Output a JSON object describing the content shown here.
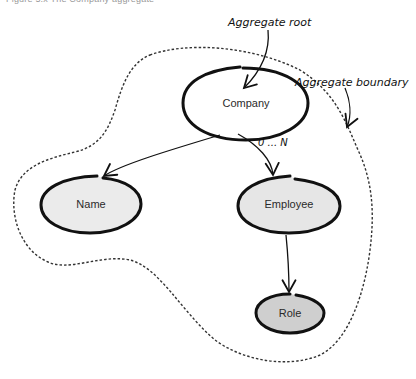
{
  "caption": "Figure 5.x  The Company aggregate",
  "annotations": {
    "aggregate_root": "Aggregate root",
    "aggregate_boundary": "Aggregate boundary",
    "multiplicity": "0 ... N"
  },
  "nodes": {
    "company": {
      "label": "Company",
      "fill": "#ffffff"
    },
    "name": {
      "label": "Name",
      "fill": "#ebebeb"
    },
    "employee": {
      "label": "Employee",
      "fill": "#e6e6e6"
    },
    "role": {
      "label": "Role",
      "fill": "#cfcfcf"
    }
  },
  "edges": [
    {
      "from": "Company",
      "to": "Name"
    },
    {
      "from": "Company",
      "to": "Employee",
      "label": "0 ... N"
    },
    {
      "from": "Employee",
      "to": "Role"
    }
  ],
  "colors": {
    "stroke": "#111111",
    "boundary": "#333333"
  }
}
